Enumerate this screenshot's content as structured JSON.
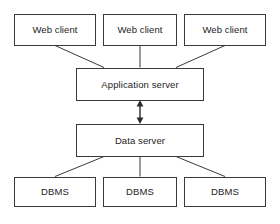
{
  "diagram": {
    "type": "block-diagram",
    "background_color": "#ffffff",
    "stroke_color": "#3a3a3a",
    "text_color": "#1d1d1d",
    "tiers": [
      {
        "name": "client-tier",
        "nodes": [
          {
            "id": "web-client-1",
            "label": "Web client"
          },
          {
            "id": "web-client-2",
            "label": "Web client"
          },
          {
            "id": "web-client-3",
            "label": "Web client"
          }
        ]
      },
      {
        "name": "application-tier",
        "nodes": [
          {
            "id": "application-server",
            "label": "Application server"
          }
        ]
      },
      {
        "name": "data-tier",
        "nodes": [
          {
            "id": "data-server",
            "label": "Data server"
          }
        ]
      },
      {
        "name": "dbms-tier",
        "nodes": [
          {
            "id": "dbms-1",
            "label": "DBMS"
          },
          {
            "id": "dbms-2",
            "label": "DBMS"
          },
          {
            "id": "dbms-3",
            "label": "DBMS"
          }
        ]
      }
    ],
    "connectors": [
      {
        "from": "web-client-1",
        "to": "application-server",
        "style": "line"
      },
      {
        "from": "web-client-2",
        "to": "application-server",
        "style": "line"
      },
      {
        "from": "web-client-3",
        "to": "application-server",
        "style": "line"
      },
      {
        "from": "application-server",
        "to": "data-server",
        "style": "double-arrow"
      },
      {
        "from": "data-server",
        "to": "dbms-1",
        "style": "line"
      },
      {
        "from": "data-server",
        "to": "dbms-2",
        "style": "line"
      },
      {
        "from": "data-server",
        "to": "dbms-3",
        "style": "line"
      }
    ]
  },
  "caption": {
    "text": ""
  }
}
